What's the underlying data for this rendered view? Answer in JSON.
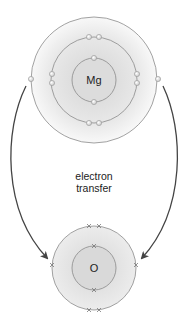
{
  "diagram": {
    "atoms": [
      {
        "symbol": "Mg",
        "shells": [
          2,
          8,
          2
        ],
        "electron_marker": "dot"
      },
      {
        "symbol": "O",
        "shells": [
          2,
          6
        ],
        "electron_marker": "cross"
      }
    ],
    "transfer_label": {
      "line1": "electron",
      "line2": "transfer"
    },
    "arrows": [
      {
        "from": "Mg outer-shell electron (left)",
        "to": "O outer shell (left)"
      },
      {
        "from": "Mg outer-shell electron (right)",
        "to": "O outer shell (right)"
      }
    ],
    "colors": {
      "shell_line": "#8a8a8a",
      "fill_gradient_center": "#d8d8d8",
      "fill_gradient_edge": "#f6f6f6",
      "arrow": "#444444",
      "text": "#222222"
    }
  }
}
